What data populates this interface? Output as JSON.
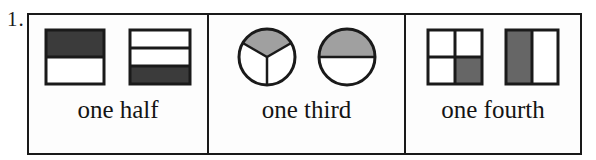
{
  "problem": {
    "number_label": "1."
  },
  "colors": {
    "ink": "#1a1a1a",
    "page_background": "#ffffff",
    "cell_background": "#fdfdfd",
    "shade_dark": "#3b3b3b",
    "shade_medium": "#666666",
    "shade_light": "#a0a0a0",
    "unshaded": "#ffffff"
  },
  "cells": [
    {
      "id": "one-half",
      "label": "one half",
      "figures": [
        {
          "id": "square-halves-horizontal",
          "shape": "square",
          "divisions": 2,
          "orientation": "horizontal-bands",
          "shaded_parts": [
            0
          ],
          "shade_color": "#3b3b3b",
          "fraction_shaded": "1/2"
        },
        {
          "id": "square-thirds-horizontal",
          "shape": "square",
          "divisions": 3,
          "orientation": "horizontal-bands",
          "shaded_parts": [
            2
          ],
          "shade_color": "#3b3b3b",
          "fraction_shaded": "1/3"
        }
      ]
    },
    {
      "id": "one-third",
      "label": "one third",
      "figures": [
        {
          "id": "circle-thirds",
          "shape": "circle",
          "divisions": 3,
          "orientation": "radial",
          "shaded_parts": [
            0
          ],
          "shade_color": "#a0a0a0",
          "fraction_shaded": "1/3"
        },
        {
          "id": "circle-halves",
          "shape": "circle",
          "divisions": 2,
          "orientation": "horizontal-bands",
          "shaded_parts": [
            0
          ],
          "shade_color": "#a0a0a0",
          "fraction_shaded": "1/2"
        }
      ]
    },
    {
      "id": "one-fourth",
      "label": "one fourth",
      "figures": [
        {
          "id": "square-quarters-grid",
          "shape": "square",
          "divisions": 4,
          "orientation": "2x2-grid",
          "shaded_parts": [
            3
          ],
          "shade_color": "#666666",
          "fraction_shaded": "1/4"
        },
        {
          "id": "square-halves-vertical",
          "shape": "square",
          "divisions": 2,
          "orientation": "vertical-bands",
          "shaded_parts": [
            0
          ],
          "shade_color": "#666666",
          "fraction_shaded": "1/2"
        }
      ]
    }
  ]
}
